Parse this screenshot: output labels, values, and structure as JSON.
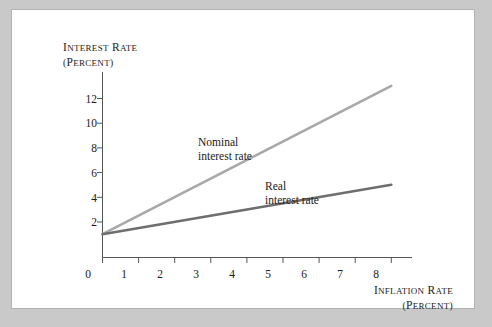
{
  "figure": {
    "background_color": "#c9c9c9",
    "panel_color": "#ffffff"
  },
  "chart_data": {
    "type": "line",
    "title": "",
    "xlabel_line1": "Inflation rate",
    "xlabel_line2": "(percent)",
    "ylabel_line1": "Interest rate",
    "ylabel_line2": "(percent)",
    "x": [
      0,
      8
    ],
    "xlim": [
      0,
      8.55
    ],
    "ylim": [
      0,
      13.8
    ],
    "xticks": [
      0,
      1,
      2,
      3,
      4,
      5,
      6,
      7,
      8
    ],
    "xtick_labels": [
      "0",
      "1",
      "2",
      "3",
      "4",
      "5",
      "6",
      "7",
      "8"
    ],
    "yticks": [
      2,
      4,
      6,
      8,
      10,
      12
    ],
    "ytick_labels": [
      "2",
      "4",
      "6",
      "8",
      "10",
      "12"
    ],
    "grid": false,
    "legend_position": "inline-annotations",
    "series": [
      {
        "name": "Nominal interest rate",
        "label_line1": "Nominal",
        "label_line2": "interest rate",
        "color": "#a8a8a8",
        "intercept": 1,
        "slope": 1.5,
        "values": [
          1,
          13
        ]
      },
      {
        "name": "Real interest rate",
        "label_line1": "Real",
        "label_line2": "interest rate",
        "color": "#6e6e6e",
        "intercept": 1,
        "slope": 0.5,
        "values": [
          1,
          5
        ]
      }
    ],
    "axis_color": "#555555"
  }
}
